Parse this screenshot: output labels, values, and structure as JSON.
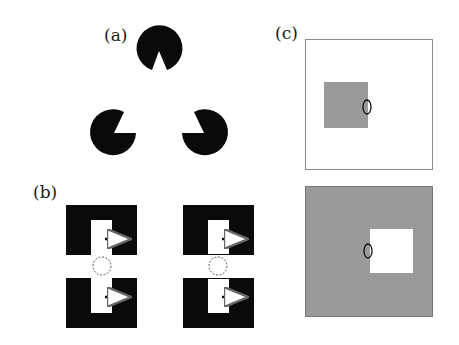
{
  "figure": {
    "panels": [
      {
        "id": "a",
        "label": "(a)",
        "description": "Kanizsa illusory triangle formed by three pac-man inducers"
      },
      {
        "id": "b",
        "label": "(b)",
        "description": "Pairs of notched black blocks with arrows and dashed circles in the gap"
      },
      {
        "id": "c",
        "label": "(c)",
        "description": "Square within a square with an ellipse marking the edge, shown with reversed contrast"
      }
    ],
    "colors": {
      "black": "#0a0a0a",
      "gray": "#9a9a9a",
      "white": "#ffffff",
      "frame": "#8a8a8a",
      "dashed": "#555555"
    }
  }
}
